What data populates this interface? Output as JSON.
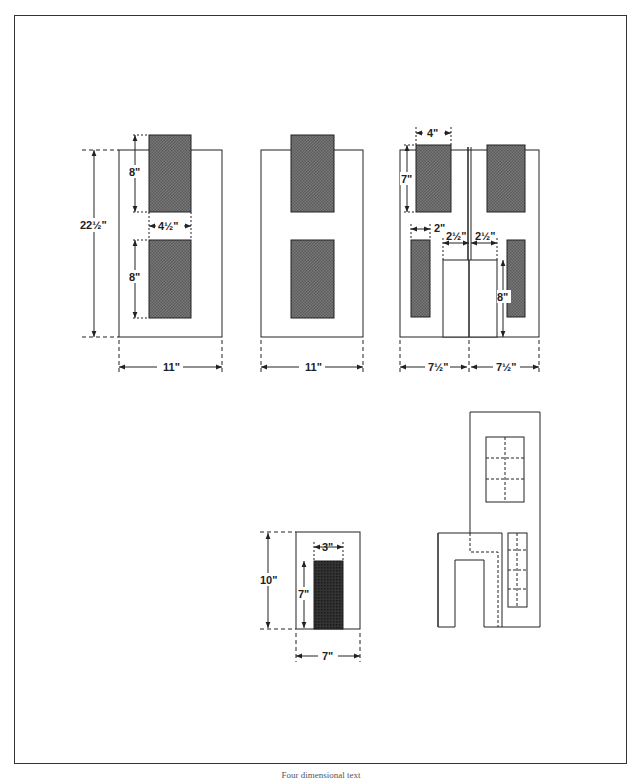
{
  "figure": {
    "caption": "Four dimensional text",
    "colors": {
      "line": "#222222",
      "panel": "#6e6e6e",
      "door": "#2a2a2a",
      "paper": "#ffffff"
    }
  },
  "panels": {
    "left": {
      "height": "22½\"",
      "width": "11\"",
      "window_h_top": "8\"",
      "window_h_bottom": "8\"",
      "window_w": "4½\""
    },
    "middle": {
      "width": "11\""
    },
    "right": {
      "half_w_left": "7½\"",
      "half_w_right": "7½\"",
      "top_window_w": "4\"",
      "top_window_h": "7\"",
      "side_window_w": "2\"",
      "door_half_left": "2½\"",
      "door_half_right": "2½\"",
      "door_h": "8\""
    }
  },
  "small_front": {
    "height": "10\"",
    "width": "7\"",
    "door_w": "3\"",
    "door_h": "7\""
  },
  "assembly": {
    "label": "assembled facade (dashed window muntins)"
  }
}
